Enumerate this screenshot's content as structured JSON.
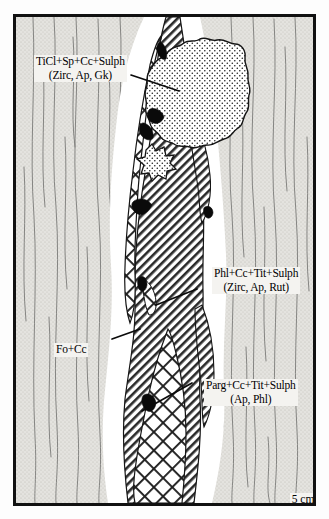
{
  "figure": {
    "kind": "petrographic-sketch",
    "border_color": "#111111",
    "host_rock_color": "#e2e1dd",
    "halo_color": "#ffffff",
    "ink_color": "#1a1a1a"
  },
  "labels": {
    "ticl": {
      "line1": "TiCl+Sp+Cc+Sulph",
      "line2": "(Zirc, Ap, Gk)"
    },
    "phl": {
      "line1": "Phl+Cc+Tit+Sulph",
      "line2": "(Zirc, Ap, Rut)"
    },
    "fo": {
      "line1": "Fo+Cc",
      "line2": ""
    },
    "parg": {
      "line1": "Parg+Cc+Tit+Sulph",
      "line2": "(Ap, Phl)"
    }
  },
  "scale": {
    "label": "5 cm",
    "value": 5,
    "unit": "cm",
    "bar_length_px": 55
  }
}
